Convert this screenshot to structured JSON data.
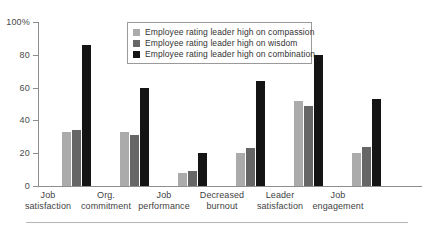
{
  "chart_data": {
    "type": "bar",
    "title": "",
    "subtitle": "",
    "xlabel": "",
    "ylabel": "",
    "ylim": [
      0,
      100
    ],
    "yticks": [
      0,
      20,
      40,
      60,
      80,
      100
    ],
    "ytick_labels": [
      "0",
      "20",
      "40",
      "60",
      "80",
      "100%"
    ],
    "grid": false,
    "legend_position": "top-center",
    "categories": [
      "Job satisfaction",
      "Org. commitment",
      "Job performance",
      "Decreased burnout",
      "Leader satisfaction",
      "Job engagement"
    ],
    "series": [
      {
        "name": "Employee rating leader high on compassion",
        "color": "#ababab",
        "values": [
          33,
          33,
          8,
          20,
          52,
          20
        ]
      },
      {
        "name": "Employee rating leader high on wisdom",
        "color": "#666666",
        "values": [
          34,
          31,
          9,
          23,
          49,
          24
        ]
      },
      {
        "name": "Employee rating leader high on combination",
        "color": "#141414",
        "values": [
          86,
          60,
          20,
          64,
          80,
          53
        ]
      }
    ]
  },
  "axis": {
    "y_tick_labels": [
      "100%",
      "80",
      "60",
      "40",
      "20",
      "0"
    ]
  },
  "legend": {
    "items": [
      "Employee rating leader high on compassion",
      "Employee rating leader high on wisdom",
      "Employee rating leader high on combination"
    ]
  },
  "x_labels": [
    {
      "line1": "Job",
      "line2": "satisfaction"
    },
    {
      "line1": "Org.",
      "line2": "commitment"
    },
    {
      "line1": "Job",
      "line2": "performance"
    },
    {
      "line1": "Decreased",
      "line2": "burnout"
    },
    {
      "line1": "Leader",
      "line2": "satisfaction"
    },
    {
      "line1": "Job",
      "line2": "engagement"
    }
  ]
}
